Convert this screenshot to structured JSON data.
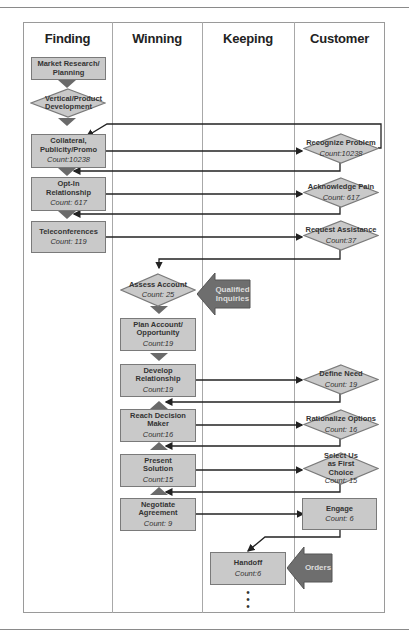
{
  "lanes": [
    "Finding",
    "Winning",
    "Keeping",
    "Customer"
  ],
  "finding": {
    "market_research": "Market Research/ Planning",
    "vertical_product": "Vertical/Product Development",
    "collateral": {
      "label": "Collateral, Publicity/Promo",
      "count": "Count:10238"
    },
    "opt_in": {
      "label": "Opt-In Relationship",
      "count": "Count: 617"
    },
    "teleconferences": {
      "label": "Teleconferences",
      "count": "Count: 119"
    }
  },
  "winning": {
    "assess_account": {
      "label": "Assess Account",
      "count": "Count: 25"
    },
    "plan_account": {
      "label": "Plan Account/ Opportunity",
      "count": "Count:19"
    },
    "develop_relationship": {
      "label": "Develop Relationship",
      "count": "Count:19"
    },
    "reach_decision_maker": {
      "label": "Reach Decision Maker",
      "count": "Count:16"
    },
    "present_solution": {
      "label": "Present Solution",
      "count": "Count:15"
    },
    "negotiate_agreement": {
      "label": "Negotiate Agreement",
      "count": "Count: 9"
    }
  },
  "keeping": {
    "handoff": {
      "label": "Handoff",
      "count": "Count:6"
    }
  },
  "customer": {
    "recognize_problem": {
      "label": "Recognize Problem",
      "count": "Count:10238"
    },
    "acknowledge_pain": {
      "label": "Acknowledge Pain",
      "count": "Count: 617"
    },
    "request_assistance": {
      "label": "Request Assistance",
      "count": "Count:37"
    },
    "define_need": {
      "label": "Define Need",
      "count": "Count: 19"
    },
    "rationalize_options": {
      "label": "Rationalize Options",
      "count": "Count: 16"
    },
    "select_us": {
      "label": "Select Us as First Choice",
      "count": "Count: 15"
    },
    "engage": {
      "label": "Engage",
      "count": "Count: 6"
    }
  },
  "callouts": {
    "qualified_inquiries": "Qualified Inquiries",
    "orders": "Orders"
  },
  "continuation": "⋮",
  "colors": {
    "box_fill": "#c9c9c9",
    "box_border": "#7a7a7a",
    "callout_fill": "#6e6e6e",
    "line": "#222222"
  }
}
